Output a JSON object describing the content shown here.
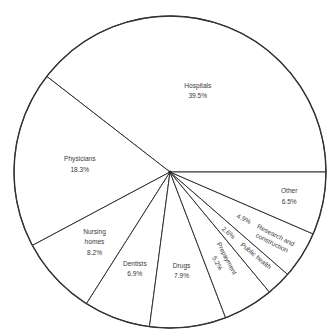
{
  "chart_data": {
    "type": "pie",
    "title": "",
    "start": "right-horizontal",
    "direction": "counterclockwise",
    "slices": [
      {
        "label": "Hospitals",
        "lines": [
          "Hospitals"
        ],
        "value": 39.5,
        "value_label": "39.5%"
      },
      {
        "label": "Physicians",
        "lines": [
          "Physicians"
        ],
        "value": 18.3,
        "value_label": "18.3%"
      },
      {
        "label": "Nursing homes",
        "lines": [
          "Nursing",
          "homes"
        ],
        "value": 8.2,
        "value_label": "8.2%"
      },
      {
        "label": "Dentists",
        "lines": [
          "Dentists"
        ],
        "value": 6.9,
        "value_label": "6.9%"
      },
      {
        "label": "Drugs",
        "lines": [
          "Drugs"
        ],
        "value": 7.9,
        "value_label": "7.9%"
      },
      {
        "label": "Prepayment",
        "lines": [
          "Prepayment"
        ],
        "value": 5.2,
        "value_label": "5.2%"
      },
      {
        "label": "Public health",
        "lines": [
          "Public health"
        ],
        "value": 2.6,
        "value_label": "2.6%"
      },
      {
        "label": "Research and construction",
        "lines": [
          "Research and",
          "construction"
        ],
        "value": 4.9,
        "value_label": "4.9%"
      },
      {
        "label": "Other",
        "lines": [
          "Other"
        ],
        "value": 6.5,
        "value_label": "6.5%"
      }
    ],
    "colors": {
      "fill": "#ffffff",
      "stroke": "#333333",
      "text": "#3a3a3a"
    }
  }
}
